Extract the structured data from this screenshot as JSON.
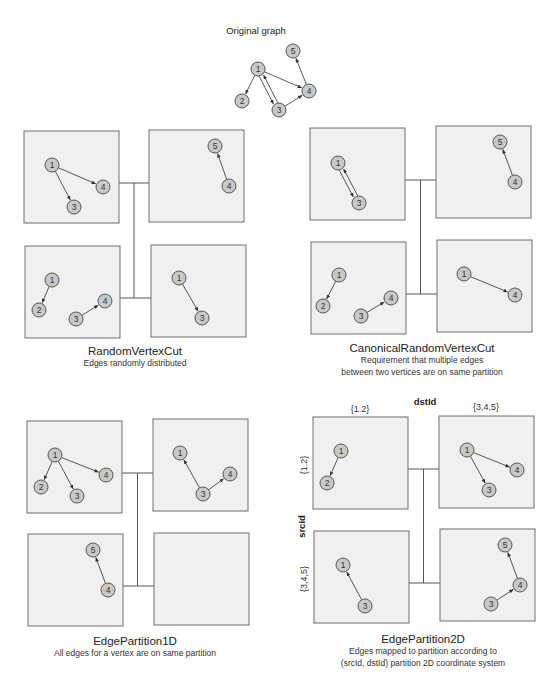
{
  "original": {
    "title": "Original graph",
    "nodes": [
      {
        "id": "1",
        "x": 258,
        "y": 69
      },
      {
        "id": "2",
        "x": 242,
        "y": 101
      },
      {
        "id": "3",
        "x": 279,
        "y": 110
      },
      {
        "id": "4",
        "x": 309,
        "y": 91
      },
      {
        "id": "5",
        "x": 293,
        "y": 51
      }
    ],
    "edges": [
      [
        "1",
        "2"
      ],
      [
        "1",
        "4"
      ],
      [
        "1",
        "3"
      ],
      [
        "3",
        "1"
      ],
      [
        "3",
        "4"
      ],
      [
        "4",
        "5"
      ]
    ]
  },
  "diagrams": [
    {
      "name": "random-vertex-cut",
      "title": "RandomVertexCut",
      "subtitle_lines": [
        "Edges randomly distributed"
      ],
      "title_pos": {
        "x": 135,
        "y": 352
      },
      "partitions": [
        {
          "box": [
            24,
            131,
            95,
            92
          ],
          "nodes": [
            {
              "id": "1",
              "x": 52,
              "y": 165
            },
            {
              "id": "3",
              "x": 74,
              "y": 207
            },
            {
              "id": "4",
              "x": 103,
              "y": 187
            }
          ],
          "edges": [
            [
              "1",
              "4"
            ],
            [
              "1",
              "3"
            ]
          ]
        },
        {
          "box": [
            149,
            130,
            95,
            92
          ],
          "nodes": [
            {
              "id": "5",
              "x": 215,
              "y": 146
            },
            {
              "id": "4",
              "x": 229,
              "y": 186
            }
          ],
          "edges": [
            [
              "4",
              "5"
            ]
          ]
        },
        {
          "box": [
            25,
            246,
            95,
            92
          ],
          "nodes": [
            {
              "id": "1",
              "x": 52,
              "y": 280
            },
            {
              "id": "2",
              "x": 39,
              "y": 310
            },
            {
              "id": "3",
              "x": 76,
              "y": 319
            },
            {
              "id": "4",
              "x": 105,
              "y": 301
            }
          ],
          "edges": [
            [
              "1",
              "2"
            ],
            [
              "3",
              "4"
            ]
          ]
        },
        {
          "box": [
            151,
            245,
            95,
            92
          ],
          "nodes": [
            {
              "id": "1",
              "x": 179,
              "y": 278
            },
            {
              "id": "3",
              "x": 202,
              "y": 318
            }
          ],
          "edges": [
            [
              "1",
              "3"
            ]
          ]
        }
      ]
    },
    {
      "name": "canonical-random-vertex-cut",
      "title": "CanonicalRandomVertexCut",
      "subtitle_lines": [
        "Requirement that multiple edges",
        "between two vertices are on same partition"
      ],
      "title_pos": {
        "x": 422,
        "y": 348
      },
      "partitions": [
        {
          "box": [
            310,
            128,
            95,
            92
          ],
          "nodes": [
            {
              "id": "1",
              "x": 338,
              "y": 163
            },
            {
              "id": "3",
              "x": 359,
              "y": 203
            }
          ],
          "edges": [
            [
              "1",
              "3"
            ],
            [
              "3",
              "1"
            ]
          ]
        },
        {
          "box": [
            436,
            126,
            95,
            92
          ],
          "nodes": [
            {
              "id": "5",
              "x": 500,
              "y": 142
            },
            {
              "id": "4",
              "x": 515,
              "y": 182
            }
          ],
          "edges": [
            [
              "4",
              "5"
            ]
          ]
        },
        {
          "box": [
            311,
            242,
            95,
            92
          ],
          "nodes": [
            {
              "id": "1",
              "x": 339,
              "y": 275
            },
            {
              "id": "2",
              "x": 323,
              "y": 306
            },
            {
              "id": "3",
              "x": 361,
              "y": 316
            },
            {
              "id": "4",
              "x": 391,
              "y": 298
            }
          ],
          "edges": [
            [
              "1",
              "2"
            ],
            [
              "3",
              "4"
            ]
          ]
        },
        {
          "box": [
            437,
            240,
            95,
            92
          ],
          "nodes": [
            {
              "id": "1",
              "x": 464,
              "y": 274
            },
            {
              "id": "4",
              "x": 515,
              "y": 295
            }
          ],
          "edges": [
            [
              "1",
              "4"
            ]
          ]
        }
      ]
    },
    {
      "name": "edge-partition-1d",
      "title": "EdgePartition1D",
      "subtitle_lines": [
        "All edges for a vertex are on same partition"
      ],
      "title_pos": {
        "x": 135,
        "y": 641
      },
      "partitions": [
        {
          "box": [
            27,
            421,
            95,
            92
          ],
          "nodes": [
            {
              "id": "1",
              "x": 55,
              "y": 455
            },
            {
              "id": "2",
              "x": 41,
              "y": 487
            },
            {
              "id": "3",
              "x": 77,
              "y": 496
            },
            {
              "id": "4",
              "x": 106,
              "y": 475
            }
          ],
          "edges": [
            [
              "1",
              "2"
            ],
            [
              "1",
              "3"
            ],
            [
              "1",
              "4"
            ]
          ]
        },
        {
          "box": [
            153,
            419,
            95,
            92
          ],
          "nodes": [
            {
              "id": "1",
              "x": 180,
              "y": 453
            },
            {
              "id": "3",
              "x": 203,
              "y": 494
            },
            {
              "id": "4",
              "x": 230,
              "y": 474
            }
          ],
          "edges": [
            [
              "3",
              "1"
            ],
            [
              "3",
              "4"
            ]
          ]
        },
        {
          "box": [
            28,
            534,
            95,
            92
          ],
          "nodes": [
            {
              "id": "5",
              "x": 93,
              "y": 550
            },
            {
              "id": "4",
              "x": 108,
              "y": 590
            }
          ],
          "edges": [
            [
              "4",
              "5"
            ]
          ]
        },
        {
          "box": [
            154,
            533,
            95,
            92
          ],
          "nodes": [],
          "edges": []
        }
      ]
    },
    {
      "name": "edge-partition-2d",
      "title": "EdgePartition2D",
      "subtitle_lines": [
        "Edges mapped to partition according to",
        "(srcId, dstId) partition 2D coordinate system"
      ],
      "title_pos": {
        "x": 422,
        "y": 641
      },
      "axis": {
        "dst_label": "dstId",
        "src_label": "srcId",
        "col_labels": [
          "{1.2}",
          "{3,4,5}"
        ],
        "row_labels": [
          "{1.2}",
          "{3,4,5}"
        ]
      },
      "partitions": [
        {
          "box": [
            313,
            417,
            95,
            92
          ],
          "nodes": [
            {
              "id": "1",
              "x": 341,
              "y": 451
            },
            {
              "id": "2",
              "x": 327,
              "y": 483
            }
          ],
          "edges": [
            [
              "1",
              "2"
            ]
          ]
        },
        {
          "box": [
            439,
            416,
            95,
            92
          ],
          "nodes": [
            {
              "id": "1",
              "x": 467,
              "y": 450
            },
            {
              "id": "3",
              "x": 489,
              "y": 490
            },
            {
              "id": "4",
              "x": 517,
              "y": 470
            }
          ],
          "edges": [
            [
              "1",
              "3"
            ],
            [
              "1",
              "4"
            ]
          ]
        },
        {
          "box": [
            314,
            531,
            95,
            92
          ],
          "nodes": [
            {
              "id": "1",
              "x": 343,
              "y": 565
            },
            {
              "id": "3",
              "x": 365,
              "y": 606
            }
          ],
          "edges": [
            [
              "3",
              "1"
            ]
          ]
        },
        {
          "box": [
            440,
            529,
            95,
            92
          ],
          "nodes": [
            {
              "id": "5",
              "x": 505,
              "y": 545
            },
            {
              "id": "4",
              "x": 520,
              "y": 585
            },
            {
              "id": "3",
              "x": 491,
              "y": 604
            }
          ],
          "edges": [
            [
              "4",
              "5"
            ],
            [
              "3",
              "4"
            ]
          ]
        }
      ]
    }
  ],
  "colors": {
    "node_fill": "#c8c8c8",
    "node_stroke": "#555555",
    "box_fill": "#f0f0f0",
    "box_stroke": "#6e6e6e",
    "edge": "#444444"
  }
}
